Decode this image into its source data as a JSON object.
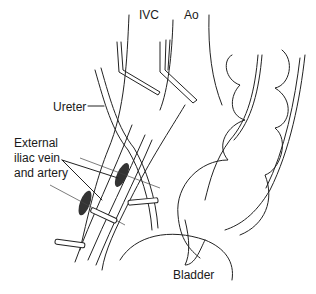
{
  "figure": {
    "type": "anatomical line drawing",
    "labels": {
      "ivc": "IVC",
      "ao": "Ao",
      "ureter": "Ureter",
      "iliac_line1": "External",
      "iliac_line2": "iliac vein",
      "iliac_line3": "and artery",
      "bladder": "Bladder"
    }
  }
}
